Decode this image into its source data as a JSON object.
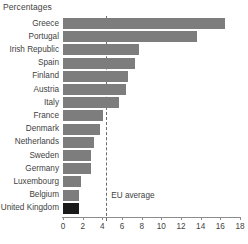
{
  "chart_data": {
    "type": "bar",
    "orientation": "horizontal",
    "title": "Percentages",
    "xlabel": "",
    "ylabel": "",
    "xlim": [
      0,
      18
    ],
    "xticks": [
      0,
      2,
      4,
      6,
      8,
      10,
      12,
      14,
      16,
      18
    ],
    "xtick_labels": [
      "0",
      "2",
      "4",
      "6",
      "8",
      "10",
      "12",
      "14",
      "16",
      "18"
    ],
    "grid": false,
    "legend": "none",
    "categories": [
      "Greece",
      "Portugal",
      "Irish Republic",
      "Spain",
      "Finland",
      "Austria",
      "Italy",
      "France",
      "Denmark",
      "Netherlands",
      "Sweden",
      "Germany",
      "Luxembourg",
      "Belgium",
      "United Kingdom"
    ],
    "values": [
      16.5,
      13.6,
      7.7,
      7.3,
      6.6,
      6.4,
      5.7,
      4.1,
      3.8,
      3.2,
      2.8,
      2.8,
      1.8,
      1.6,
      1.6
    ],
    "bar_colors": [
      "#7d7d7d",
      "#7d7d7d",
      "#7d7d7d",
      "#7d7d7d",
      "#7d7d7d",
      "#7d7d7d",
      "#7d7d7d",
      "#7d7d7d",
      "#7d7d7d",
      "#7d7d7d",
      "#7d7d7d",
      "#7d7d7d",
      "#7d7d7d",
      "#7d7d7d",
      "#1a1a1a"
    ],
    "annotations": [
      {
        "name": "eu-average",
        "label": "EU average",
        "value": 4.4,
        "style": "dashed-vertical-line",
        "color": "#6b6b6b"
      }
    ],
    "colors": {
      "bar": "#7d7d7d",
      "highlight_bar": "#1a1a1a",
      "axis": "#8c8c8c",
      "text": "#3f3f3f",
      "background": "#ffffff"
    }
  }
}
